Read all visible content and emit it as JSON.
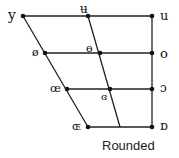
{
  "title": "Rounded",
  "vowels": {
    "close_front": "y",
    "close_central": "ʉ",
    "close_back": "u",
    "closemid_front": "ø",
    "closemid_central": "ɵ",
    "closemid_back": "o",
    "openmid_front": "œ",
    "openmid_central": "ɞ",
    "openmid_back": "ɔ",
    "open_front": "ɶ",
    "open_back": "ɒ"
  },
  "colors": {
    "line": "#222222",
    "dot": "#111111"
  }
}
